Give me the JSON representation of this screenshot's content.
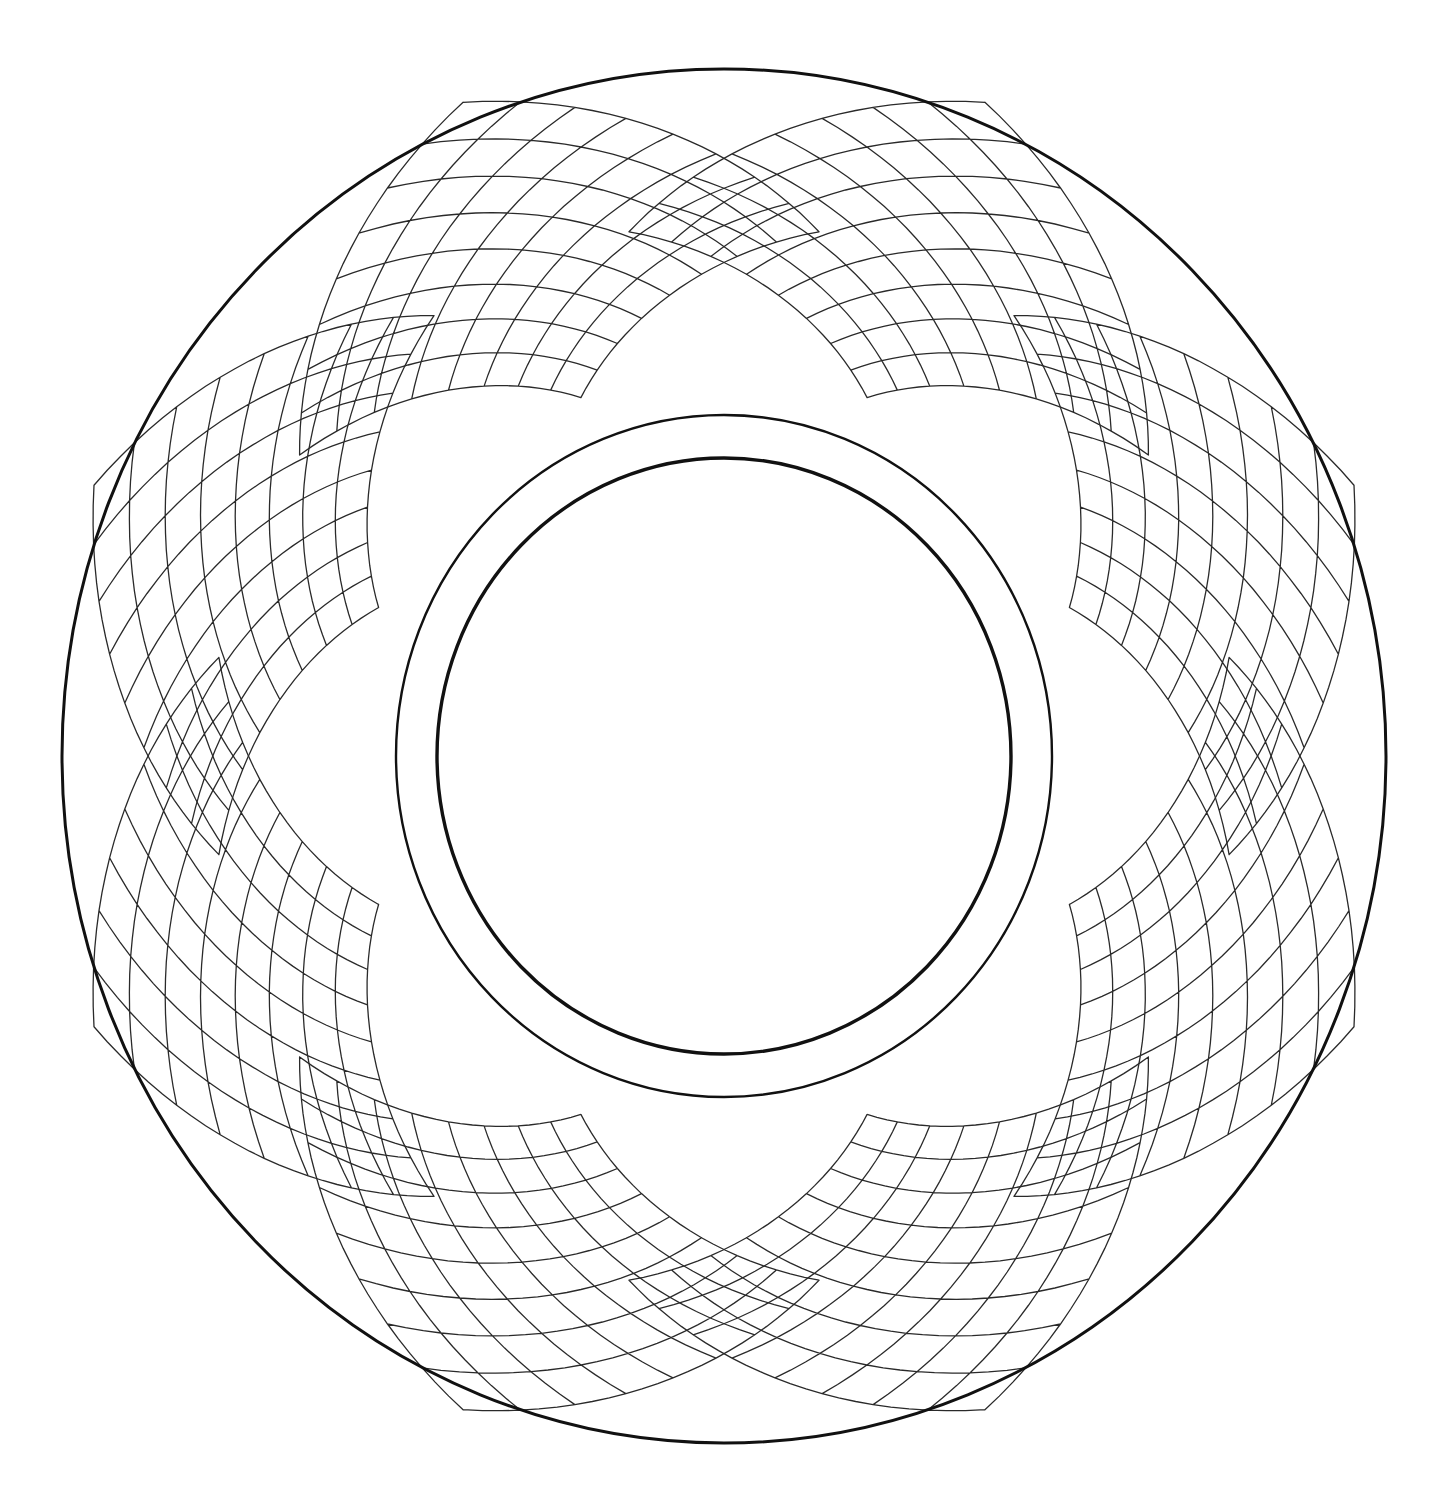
{
  "artwork": {
    "kind": "coloring-page-line-art",
    "description": "Circular mandala: outer circle, overlapping curved grid petals, double inner ring",
    "canvas": {
      "width": 1453,
      "height": 1497,
      "background": "#ffffff"
    },
    "center": {
      "x": 724,
      "y": 756
    },
    "line_color": "#111111",
    "circles": [
      {
        "name": "outer-circle",
        "rx": 662,
        "ry": 687,
        "stroke_width": 3
      },
      {
        "name": "ring-outer-line",
        "rx": 328,
        "ry": 341,
        "stroke_width": 2.4
      },
      {
        "name": "ring-inner-line",
        "rx": 287,
        "ry": 298,
        "stroke_width": 3.4
      }
    ],
    "lattice": {
      "patch_count": 8,
      "start_angle_deg": -112.5,
      "grid_divisions": 8,
      "inner_radius": 360,
      "outer_radius": 668,
      "angular_half_width_deg": 34,
      "bulge": 0.18,
      "stroke_color": "#2a2a2a",
      "stroke_width": 1.3
    }
  }
}
